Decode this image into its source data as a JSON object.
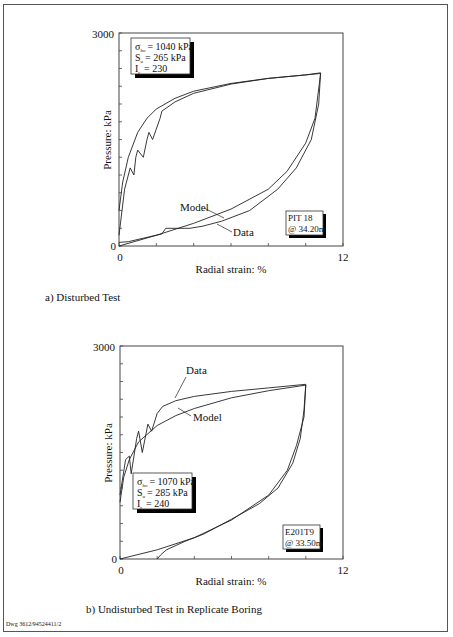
{
  "footer": {
    "drawing_number": "Dwg 3612/94524411/2"
  },
  "panels": [
    {
      "caption": "a) Disturbed Test",
      "ylabel": "Pressure: kPa",
      "xlabel": "Radial strain: %",
      "y_top_tick": "3000",
      "y_bottom_tick": "0",
      "x_left_tick": "0",
      "x_right_tick": "12",
      "params": {
        "line1_sym": "σ",
        "line1_sub": "ho",
        "line1_val": "= 1040 kPa",
        "line2_sym": "S",
        "line2_sub": "u",
        "line2_val": "= 265 kPa",
        "line3_sym": "I",
        "line3_sub": "r",
        "line3_val": "= 230"
      },
      "location": {
        "line1": "PIT 18",
        "line2": "@ 34.20m"
      },
      "annotations": {
        "model": "Model",
        "data": "Data"
      }
    },
    {
      "caption": "b) Undisturbed Test in Replicate Boring",
      "ylabel": "Pressure: kPa",
      "xlabel": "Radial strain: %",
      "y_top_tick": "3000",
      "y_bottom_tick": "0",
      "x_left_tick": "0",
      "x_right_tick": "12",
      "params": {
        "line1_sym": "σ",
        "line1_sub": "ho",
        "line1_val": "= 1070 kPa",
        "line2_sym": "S",
        "line2_sub": "u",
        "line2_val": "= 285 kPa",
        "line3_sym": "I",
        "line3_sub": "r",
        "line3_val": "= 240"
      },
      "location": {
        "line1": "E201T9",
        "line2": "@ 33.50m"
      },
      "annotations": {
        "model": "Model",
        "data": "Data"
      }
    }
  ],
  "chart_data": [
    {
      "type": "line",
      "title": "a) Disturbed Test",
      "xlabel": "Radial strain: %",
      "ylabel": "Pressure: kPa",
      "xlim": [
        0,
        12
      ],
      "ylim": [
        0,
        3000
      ],
      "x_ticks": [
        0,
        2,
        4,
        6,
        8,
        10,
        12
      ],
      "y_ticks": [
        0,
        250,
        500,
        750,
        1000,
        1250,
        1500,
        1750,
        2000,
        2250,
        2500,
        2750,
        3000
      ],
      "grid": false,
      "legend": "inline annotations (Model, Data)",
      "annotations": [
        "σho = 1040 kPa",
        "Su = 265 kPa",
        "Ir = 230",
        "PIT 18 @ 34.20m"
      ],
      "series": [
        {
          "name": "Model",
          "x": [
            0,
            0.2,
            0.5,
            1.0,
            1.5,
            2.0,
            3.0,
            4.0,
            6.0,
            8.0,
            10.0,
            10.8,
            10.5,
            10.0,
            9.0,
            8.0,
            6.0,
            4.0,
            2.0,
            0
          ],
          "y": [
            500,
            900,
            1250,
            1600,
            1800,
            1930,
            2080,
            2180,
            2290,
            2360,
            2410,
            2430,
            1800,
            1450,
            1050,
            800,
            520,
            320,
            150,
            0
          ]
        },
        {
          "name": "Data",
          "x": [
            0,
            0.3,
            0.6,
            0.8,
            0.9,
            1.0,
            1.3,
            1.5,
            1.6,
            1.8,
            2.2,
            2.3,
            3.0,
            4.0,
            6.0,
            8.0,
            10.0,
            10.8,
            10.7,
            10.3,
            9.5,
            8.5,
            7.0,
            5.5,
            4.5,
            3.8,
            3.5,
            2.5,
            2.3,
            0.5,
            0
          ],
          "y": [
            150,
            800,
            1100,
            1000,
            1250,
            1350,
            1250,
            1500,
            1600,
            1500,
            1800,
            1900,
            2030,
            2150,
            2280,
            2360,
            2410,
            2440,
            2000,
            1500,
            1100,
            800,
            500,
            350,
            280,
            250,
            250,
            250,
            170,
            60,
            50
          ]
        }
      ]
    },
    {
      "type": "line",
      "title": "b) Undisturbed Test in Replicate Boring",
      "xlabel": "Radial strain: %",
      "ylabel": "Pressure: kPa",
      "xlim": [
        0,
        12
      ],
      "ylim": [
        0,
        3000
      ],
      "x_ticks": [
        0,
        2,
        4,
        6,
        8,
        10,
        12
      ],
      "y_ticks": [
        0,
        250,
        500,
        750,
        1000,
        1250,
        1500,
        1750,
        2000,
        2250,
        2500,
        2750,
        3000
      ],
      "grid": false,
      "legend": "inline annotations (Model, Data)",
      "annotations": [
        "σho = 1070 kPa",
        "Su = 285 kPa",
        "Ir = 240",
        "E201T9 @ 33.50m"
      ],
      "series": [
        {
          "name": "Model",
          "x": [
            0,
            0.2,
            0.5,
            1.0,
            2.0,
            3.0,
            4.0,
            6.0,
            8.0,
            10.0,
            9.9,
            9.5,
            9.0,
            8.0,
            6.0,
            4.0,
            2.0,
            0
          ],
          "y": [
            800,
            1150,
            1400,
            1650,
            1880,
            2020,
            2120,
            2270,
            2370,
            2450,
            2000,
            1600,
            1250,
            900,
            550,
            300,
            130,
            0
          ]
        },
        {
          "name": "Data",
          "x": [
            0,
            0.3,
            0.5,
            0.6,
            0.9,
            1.0,
            1.2,
            1.5,
            1.7,
            2.0,
            2.3,
            3.0,
            4.0,
            6.0,
            8.0,
            10.0,
            9.9,
            9.7,
            9.3,
            8.5,
            7.5,
            6.0,
            4.5,
            3.5,
            2.5,
            2.2,
            2.0
          ],
          "y": [
            900,
            1400,
            1450,
            1200,
            1700,
            1800,
            1500,
            1900,
            1800,
            2050,
            2150,
            2230,
            2290,
            2360,
            2410,
            2460,
            2100,
            1700,
            1350,
            1000,
            780,
            560,
            350,
            250,
            130,
            60,
            0
          ]
        }
      ]
    }
  ]
}
